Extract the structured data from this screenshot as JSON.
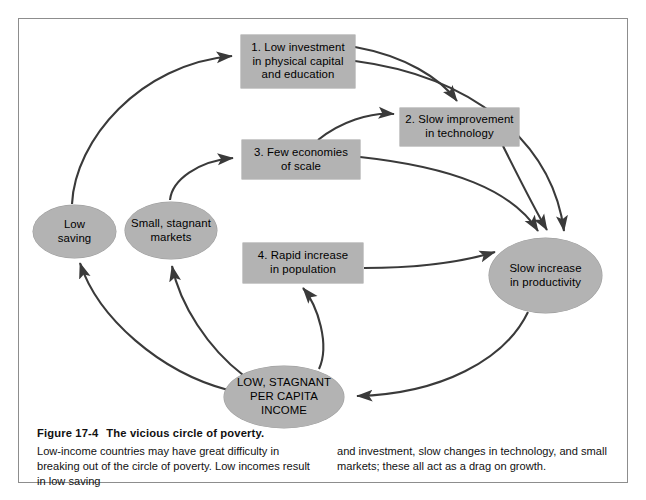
{
  "figure": {
    "number": "Figure 17-4",
    "title": "The vicious circle of poverty.",
    "caption_left": "Low-income countries may have great difficulty in breaking out of the circle of poverty. Low incomes result in low saving",
    "caption_right": "and investment, slow changes in technology, and small markets; these all act as a drag on growth."
  },
  "style": {
    "node_fill": "#b3b3b3",
    "arrow_color": "#3a3a3a",
    "frame_color": "#8d8d8d",
    "background": "#ffffff"
  },
  "nodes": {
    "box1": {
      "label": "1.  Low investment\nin physical capital\nand education",
      "shape": "rectangle"
    },
    "box2": {
      "label": "2.  Slow improvement\nin technology",
      "shape": "rectangle"
    },
    "box3": {
      "label": "3.  Few economies\nof scale",
      "shape": "rectangle"
    },
    "box4": {
      "label": "4. Rapid increase\nin population",
      "shape": "rectangle"
    },
    "low_saving": {
      "label": "Low\nsaving",
      "shape": "ellipse"
    },
    "small_markets": {
      "label": "Small, stagnant\nmarkets",
      "shape": "ellipse"
    },
    "productivity": {
      "label": "Slow increase\nin productivity",
      "shape": "ellipse"
    },
    "income": {
      "label": "LOW, STAGNANT\nPER CAPITA\nINCOME",
      "shape": "ellipse"
    }
  },
  "edges": [
    {
      "from": "low_saving",
      "to": "box1"
    },
    {
      "from": "small_markets",
      "to": "box3"
    },
    {
      "from": "box1",
      "to": "box2"
    },
    {
      "from": "box1",
      "to": "productivity"
    },
    {
      "from": "box3",
      "to": "box2"
    },
    {
      "from": "box3",
      "to": "productivity"
    },
    {
      "from": "box2",
      "to": "productivity"
    },
    {
      "from": "box4",
      "to": "productivity"
    },
    {
      "from": "productivity",
      "to": "income"
    },
    {
      "from": "income",
      "to": "low_saving"
    },
    {
      "from": "income",
      "to": "small_markets"
    },
    {
      "from": "income",
      "to": "box4"
    }
  ]
}
